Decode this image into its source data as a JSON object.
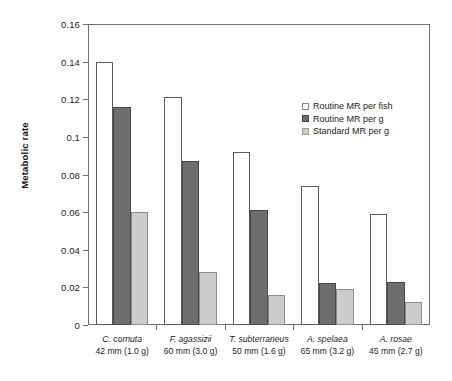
{
  "chart_data": {
    "type": "bar",
    "title": "",
    "xlabel": "",
    "ylabel": "Metabolic rate",
    "ylim": [
      0,
      0.16
    ],
    "ytick_labels": [
      "0",
      "0.02",
      "0.04",
      "0.06",
      "0.08",
      "0.1",
      "0.12",
      "0.14",
      "0.16"
    ],
    "ytick_values": [
      0,
      0.02,
      0.04,
      0.06,
      0.08,
      0.1,
      0.12,
      0.14,
      0.16
    ],
    "grid": false,
    "legend_position": "upper right inside",
    "categories": [
      "C. cornuta 42 mm (1.0 g)",
      "F. agassizii 60 mm (3.0 g)",
      "T. subterraneus 50 mm (1.6 g)",
      "A. spelaea 65 mm (3.2 g)",
      "A. rosae 45 mm (2.7 g)"
    ],
    "category_labels": [
      {
        "species": "C. cornuta",
        "size": "42 mm (1.0 g)"
      },
      {
        "species": "F. agassizii",
        "size": "60 mm (3.0 g)"
      },
      {
        "species": "T. subterraneus",
        "size": "50 mm (1.6 g)"
      },
      {
        "species": "A. spelaea",
        "size": "65 mm (3.2 g)"
      },
      {
        "species": "A. rosae",
        "size": "45 mm (2.7 g)"
      }
    ],
    "series": [
      {
        "name": "Routine MR per fish",
        "color": "#ffffff",
        "values": [
          0.14,
          0.121,
          0.092,
          0.074,
          0.059
        ]
      },
      {
        "name": "Routine MR per g",
        "color": "#6e6e6e",
        "values": [
          0.116,
          0.087,
          0.061,
          0.0225,
          0.023
        ]
      },
      {
        "name": "Standard MR per g",
        "color": "#cccccc",
        "values": [
          0.06,
          0.028,
          0.016,
          0.019,
          0.012
        ]
      }
    ]
  },
  "legend": {
    "items": [
      {
        "label": "Routine MR per fish"
      },
      {
        "label": "Routine MR per g"
      },
      {
        "label": "Standard MR per g"
      }
    ]
  }
}
